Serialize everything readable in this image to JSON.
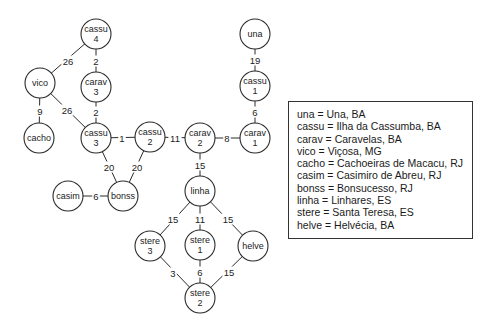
{
  "diagram": {
    "type": "network",
    "node_radius": 15,
    "nodes": [
      {
        "id": "cassu4",
        "lines": [
          "cassu",
          "4"
        ],
        "x": 96,
        "y": 34
      },
      {
        "id": "vico",
        "lines": [
          "vico"
        ],
        "x": 40,
        "y": 83
      },
      {
        "id": "carav3",
        "lines": [
          "carav",
          "3"
        ],
        "x": 96,
        "y": 87
      },
      {
        "id": "cacho",
        "lines": [
          "cacho"
        ],
        "x": 39,
        "y": 138
      },
      {
        "id": "cassu3",
        "lines": [
          "cassu",
          "3"
        ],
        "x": 96,
        "y": 138
      },
      {
        "id": "cassu2",
        "lines": [
          "cassu",
          "2"
        ],
        "x": 150,
        "y": 137
      },
      {
        "id": "carav2",
        "lines": [
          "carav",
          "2"
        ],
        "x": 200,
        "y": 138
      },
      {
        "id": "carav1",
        "lines": [
          "carav",
          "1"
        ],
        "x": 255,
        "y": 138
      },
      {
        "id": "cassu1",
        "lines": [
          "cassu",
          "1"
        ],
        "x": 255,
        "y": 86
      },
      {
        "id": "una",
        "lines": [
          "una"
        ],
        "x": 255,
        "y": 34
      },
      {
        "id": "casim",
        "lines": [
          "casim"
        ],
        "x": 68,
        "y": 196
      },
      {
        "id": "bonss",
        "lines": [
          "bonss"
        ],
        "x": 123,
        "y": 196
      },
      {
        "id": "linha",
        "lines": [
          "linha"
        ],
        "x": 200,
        "y": 191
      },
      {
        "id": "stere3",
        "lines": [
          "stere",
          "3"
        ],
        "x": 150,
        "y": 246
      },
      {
        "id": "stere1",
        "lines": [
          "stere",
          "1"
        ],
        "x": 200,
        "y": 245
      },
      {
        "id": "helve",
        "lines": [
          "helve"
        ],
        "x": 253,
        "y": 246
      },
      {
        "id": "stere2",
        "lines": [
          "stere",
          "2"
        ],
        "x": 200,
        "y": 298
      }
    ],
    "edges": [
      {
        "from": "cassu4",
        "to": "vico",
        "label": "26",
        "lx": 68,
        "ly": 61
      },
      {
        "from": "cassu4",
        "to": "carav3",
        "label": "2",
        "lx": 96,
        "ly": 61
      },
      {
        "from": "vico",
        "to": "cassu3",
        "label": "26",
        "lx": 67,
        "ly": 110
      },
      {
        "from": "vico",
        "to": "cacho",
        "label": "9",
        "lx": 40,
        "ly": 111
      },
      {
        "from": "carav3",
        "to": "cassu3",
        "label": "2",
        "lx": 96,
        "ly": 112
      },
      {
        "from": "cassu3",
        "to": "cassu2",
        "label": "1",
        "lx": 122,
        "ly": 138
      },
      {
        "from": "cassu2",
        "to": "carav2",
        "label": "11",
        "lx": 175,
        "ly": 138
      },
      {
        "from": "carav2",
        "to": "carav1",
        "label": "8",
        "lx": 227,
        "ly": 138
      },
      {
        "from": "carav1",
        "to": "cassu1",
        "label": "6",
        "lx": 255,
        "ly": 112
      },
      {
        "from": "cassu1",
        "to": "una",
        "label": "19",
        "lx": 255,
        "ly": 60
      },
      {
        "from": "cassu3",
        "to": "bonss",
        "label": "20",
        "lx": 109,
        "ly": 167
      },
      {
        "from": "cassu2",
        "to": "bonss",
        "label": "20",
        "lx": 137,
        "ly": 167
      },
      {
        "from": "casim",
        "to": "bonss",
        "label": "6",
        "lx": 96,
        "ly": 196
      },
      {
        "from": "carav2",
        "to": "linha",
        "label": "15",
        "lx": 200,
        "ly": 165
      },
      {
        "from": "linha",
        "to": "stere3",
        "label": "15",
        "lx": 173,
        "ly": 219
      },
      {
        "from": "linha",
        "to": "stere1",
        "label": "11",
        "lx": 200,
        "ly": 219
      },
      {
        "from": "linha",
        "to": "helve",
        "label": "15",
        "lx": 228,
        "ly": 219
      },
      {
        "from": "stere3",
        "to": "stere2",
        "label": "3",
        "lx": 173,
        "ly": 273
      },
      {
        "from": "stere1",
        "to": "stere2",
        "label": "6",
        "lx": 200,
        "ly": 272
      },
      {
        "from": "helve",
        "to": "stere2",
        "label": "15",
        "lx": 229,
        "ly": 272
      }
    ]
  },
  "legend": {
    "lines": [
      "una = Una, BA",
      "cassu = Ilha da Cassumba, BA",
      "carav = Caravelas, BA",
      "vico = Viçosa, MG",
      "cacho = Cachoeiras de Macacu, RJ",
      "casim = Casimiro de Abreu, RJ",
      "bonss = Bonsucesso, RJ",
      "linha = Linhares, ES",
      "stere = Santa Teresa, ES",
      "helve = Helvécia, BA"
    ]
  }
}
